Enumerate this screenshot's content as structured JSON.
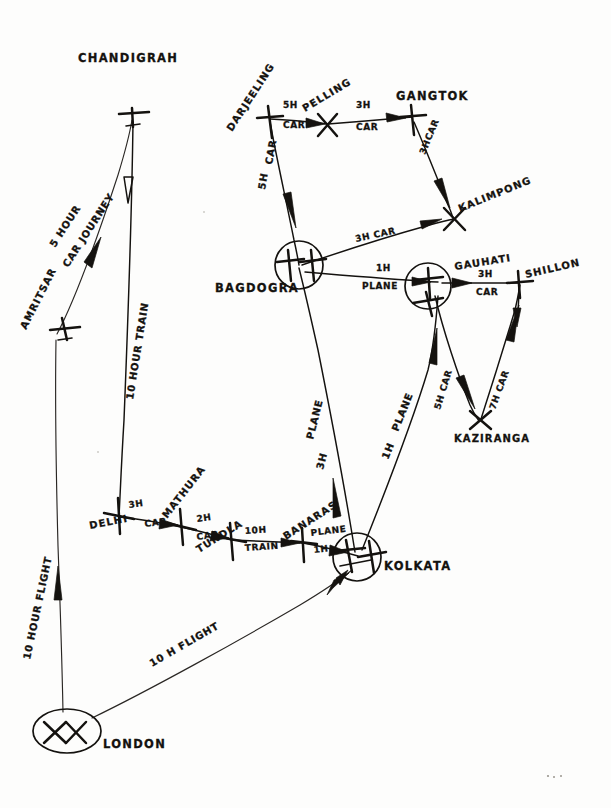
{
  "diagram": {
    "medium": "pencil sketch on paper",
    "ink_color": "#14120f",
    "paper_color": "#fdfdfc"
  },
  "places": {
    "chandigrah": {
      "label": "CHANDIGRAH",
      "marker": "airplane-cross",
      "x": 132,
      "y": 113
    },
    "amritsar": {
      "label": "AMRITSAR",
      "marker": "airplane-cross",
      "x": 66,
      "y": 325
    },
    "london": {
      "label": "LONDON",
      "marker": "double-airplane-ellipse",
      "x": 66,
      "y": 730
    },
    "delhi": {
      "label": "DELHI",
      "marker": "cross",
      "x": 119,
      "y": 516
    },
    "mathura": {
      "label": "MATHURA",
      "marker": "cross",
      "x": 181,
      "y": 526
    },
    "tundla": {
      "label": "TUNDLA",
      "marker": "cross",
      "x": 231,
      "y": 540
    },
    "banaras": {
      "label": "BANARAS",
      "marker": "cross",
      "x": 302,
      "y": 543
    },
    "kolkata": {
      "label": "KOLKATA",
      "marker": "airplane-circle",
      "x": 357,
      "y": 556
    },
    "bagdogra": {
      "label": "BAGDOGRA",
      "marker": "airplane-circle",
      "x": 297,
      "y": 266
    },
    "darjeeling": {
      "label": "DARJEELING",
      "marker": "cross",
      "x": 269,
      "y": 119
    },
    "pelling": {
      "label": "PELLING",
      "marker": "cross",
      "x": 327,
      "y": 123
    },
    "gangtok": {
      "label": "GANGTOK",
      "marker": "cross",
      "x": 411,
      "y": 117
    },
    "kalimpong": {
      "label": "KALIMPONG",
      "marker": "cross",
      "x": 452,
      "y": 218
    },
    "gauhati": {
      "label": "GAUHATI",
      "marker": "airplane-circle",
      "x": 438,
      "y": 282
    },
    "shillong": {
      "label": "SHILLON",
      "marker": "cross",
      "x": 518,
      "y": 283
    },
    "kaziranga": {
      "label": "KAZIRANGA",
      "marker": "cross",
      "x": 479,
      "y": 420
    }
  },
  "legs": [
    {
      "id": "london-amritsar",
      "from": "LONDON",
      "to": "AMRITSAR",
      "duration": "10 HOUR",
      "mode": "FLIGHT",
      "label": "10 HOUR FLIGHT"
    },
    {
      "id": "amritsar-chandigrah",
      "from": "AMRITSAR",
      "to": "CHANDIGRAH",
      "duration": "5 HOUR",
      "mode": "CAR JOURNEY",
      "label": "5 HOUR CAR JOURNEY"
    },
    {
      "id": "chandigrah-delhi",
      "from": "CHANDIGRAH",
      "to": "DELHI",
      "duration": "10 HOUR",
      "mode": "TRAIN",
      "label": "10 HOUR TRAIN"
    },
    {
      "id": "delhi-mathura",
      "from": "DELHI",
      "to": "MATHURA",
      "duration": "3H",
      "mode": "CAR",
      "label": "3H CAR"
    },
    {
      "id": "mathura-tundla",
      "from": "MATHURA",
      "to": "TUNDLA",
      "duration": "2H",
      "mode": "CAR",
      "label": "2H CAR"
    },
    {
      "id": "tundla-banaras",
      "from": "TUNDLA",
      "to": "BANARAS",
      "duration": "10H",
      "mode": "TRAIN",
      "label": "10H TRAIN"
    },
    {
      "id": "banaras-kolkata",
      "from": "BANARAS",
      "to": "KOLKATA",
      "duration": "1H",
      "mode": "PLANE",
      "label": "PLANE 1H"
    },
    {
      "id": "london-kolkata",
      "from": "LONDON",
      "to": "KOLKATA",
      "duration": "10 H",
      "mode": "FLIGHT",
      "label": "10 H FLIGHT"
    },
    {
      "id": "kolkata-bagdogra",
      "from": "KOLKATA",
      "to": "BAGDOGRA",
      "duration": "3H",
      "mode": "PLANE",
      "label": "3H PLANE"
    },
    {
      "id": "darjeeling-bagdogra",
      "from": "DARJEELING",
      "to": "BAGDOGRA",
      "duration": "5H",
      "mode": "CAR",
      "label": "5H CAR"
    },
    {
      "id": "darjeeling-pelling",
      "from": "DARJEELING",
      "to": "PELLING",
      "duration": "5H",
      "mode": "CAR",
      "label": "5H CAR"
    },
    {
      "id": "pelling-gangtok",
      "from": "PELLING",
      "to": "GANGTOK",
      "duration": "3H",
      "mode": "CAR",
      "label": "3H CAR"
    },
    {
      "id": "gangtok-kalimpong",
      "from": "GANGTOK",
      "to": "KALIMPONG",
      "duration": "3H",
      "mode": "CAR",
      "label": "3H CAR"
    },
    {
      "id": "bagdogra-kalimpong",
      "from": "BAGDOGRA",
      "to": "KALIMPONG",
      "duration": "3H",
      "mode": "CAR",
      "label": "3H CAR"
    },
    {
      "id": "bagdogra-gauhati",
      "from": "BAGDOGRA",
      "to": "GAUHATI",
      "duration": "1H",
      "mode": "PLANE",
      "label": "1H PLANE"
    },
    {
      "id": "kolkata-gauhati",
      "from": "KOLKATA",
      "to": "GAUHATI",
      "duration": "1H",
      "mode": "PLANE",
      "label": "1H PLANE"
    },
    {
      "id": "gauhati-shillong",
      "from": "GAUHATI",
      "to": "SHILLON",
      "duration": "3H",
      "mode": "CAR",
      "label": "3H CAR"
    },
    {
      "id": "gauhati-kaziranga",
      "from": "GAUHATI",
      "to": "KAZIRANGA",
      "duration": "5H",
      "mode": "CAR",
      "label": "5H CAR"
    },
    {
      "id": "kaziranga-shillong",
      "from": "KAZIRANGA",
      "to": "SHILLON",
      "duration": "7H",
      "mode": "CAR",
      "label": "7H CAR"
    }
  ],
  "leg_labels": {
    "l_10hour_flight": "10 HOUR FLIGHT",
    "l_5hour": "5 HOUR",
    "l_car_journey": "CAR JOURNEY",
    "l_10hour_train": "10 HOUR TRAIN",
    "l_3h_a": "3H",
    "l_car_a": "CAR",
    "l_2h": "2H",
    "l_car_b": "CAR",
    "l_10h": "10H",
    "l_train": "TRAIN",
    "l_plane": "PLANE",
    "l_1h": "1H",
    "l_10h_flight": "10 H FLIGHT",
    "l_3h_plane_a": "3H",
    "l_plane_b": "PLANE",
    "l_5h_car_darj_a": "5H",
    "l_car_darj_a": "CAR",
    "l_5h_pell": "5H",
    "l_car_pell": "CAR",
    "l_3h_gang": "3H",
    "l_car_gang": "CAR",
    "l_3hcar_kalim": "3HCAR",
    "l_3h_car_bag": "3H CAR",
    "l_1h_bag": "1H",
    "l_plane_bag": "PLANE",
    "l_1h_kol": "1H",
    "l_plane_kol": "PLANE",
    "l_3h_shil": "3H",
    "l_car_shil": "CAR",
    "l_5h_kazi": "5H CAR",
    "l_7h_kazi": "7H CAR"
  }
}
